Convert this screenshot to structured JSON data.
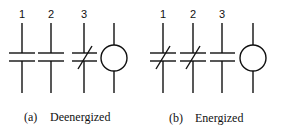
{
  "panels": [
    {
      "caption_letter": "(a)",
      "caption_text": "Deenergized",
      "contacts": [
        {
          "label": "1",
          "x": 22,
          "state": "normally-open"
        },
        {
          "label": "2",
          "x": 51,
          "state": "normally-open"
        },
        {
          "label": "3",
          "x": 84,
          "state": "normally-closed"
        }
      ],
      "coil": {
        "x": 114
      }
    },
    {
      "caption_letter": "(b)",
      "caption_text": "Energized",
      "contacts": [
        {
          "label": "1",
          "x": 163,
          "state": "closed"
        },
        {
          "label": "2",
          "x": 193,
          "state": "closed"
        },
        {
          "label": "3",
          "x": 222,
          "state": "open"
        }
      ],
      "coil": {
        "x": 253
      }
    }
  ]
}
